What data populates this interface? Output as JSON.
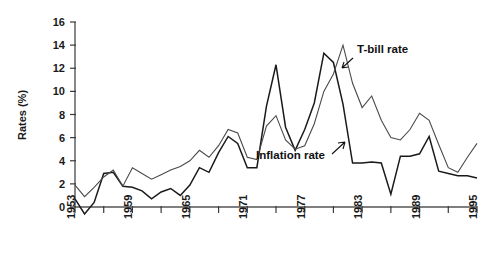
{
  "chart_data": {
    "type": "line",
    "title": "",
    "xlabel": "",
    "ylabel": "Rates (%)",
    "xlim": [
      1953,
      1995
    ],
    "ylim": [
      0,
      16
    ],
    "grid": false,
    "legend_position": "inline-annotations",
    "x_major_ticks": [
      "1953",
      "1959",
      "1965",
      "1971",
      "1977",
      "1983",
      "1989",
      "1995"
    ],
    "x_minor_tick_interval": 3,
    "y_ticks": [
      "0",
      "2",
      "4",
      "6",
      "8",
      "10",
      "12",
      "14",
      "16"
    ],
    "annotations": [
      {
        "text": "T-bill rate",
        "points_to_year": 1981,
        "points_to_value": 13.0
      },
      {
        "text": "Inflation rate",
        "points_to_year": 1982,
        "points_to_value": 6.2
      }
    ],
    "x": [
      1953,
      1954,
      1955,
      1956,
      1957,
      1958,
      1959,
      1960,
      1961,
      1962,
      1963,
      1964,
      1965,
      1966,
      1967,
      1968,
      1969,
      1970,
      1971,
      1972,
      1973,
      1974,
      1975,
      1976,
      1977,
      1978,
      1979,
      1980,
      1981,
      1982,
      1983,
      1984,
      1985,
      1986,
      1987,
      1988,
      1989,
      1990,
      1991,
      1992,
      1993,
      1994,
      1995
    ],
    "series": [
      {
        "name": "Inflation rate",
        "color": "#1a1a1a",
        "width": 1.5,
        "values": [
          0.7,
          -0.6,
          0.4,
          2.9,
          3.0,
          1.8,
          1.7,
          1.4,
          0.7,
          1.3,
          1.6,
          1.0,
          1.9,
          3.4,
          3.0,
          4.7,
          6.1,
          5.5,
          3.4,
          3.4,
          8.7,
          12.3,
          6.9,
          4.9,
          6.7,
          9.0,
          13.3,
          12.5,
          8.9,
          3.8,
          3.8,
          3.9,
          3.8,
          1.1,
          4.4,
          4.4,
          4.6,
          6.1,
          3.1,
          2.9,
          2.7,
          2.7,
          2.5
        ],
        "marker": "none"
      },
      {
        "name": "T-bill rate",
        "color": "#4a4a4a",
        "width": 1.1,
        "values": [
          1.9,
          0.9,
          1.7,
          2.6,
          3.2,
          1.8,
          3.4,
          2.9,
          2.4,
          2.8,
          3.2,
          3.5,
          4.0,
          4.9,
          4.3,
          5.3,
          6.7,
          6.4,
          4.3,
          4.1,
          7.0,
          7.9,
          5.8,
          5.0,
          5.3,
          7.2,
          10.0,
          11.5,
          14.0,
          10.7,
          8.6,
          9.6,
          7.5,
          6.0,
          5.8,
          6.7,
          8.1,
          7.5,
          5.4,
          3.4,
          3.0,
          4.3,
          5.5
        ],
        "marker": "none"
      }
    ]
  }
}
